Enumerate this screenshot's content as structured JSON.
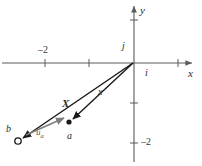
{
  "figure": {
    "type": "vector-diagram",
    "width": 202,
    "height": 166,
    "background": "#ffffff",
    "colors": {
      "axis": "#5a5a5a",
      "vector": "#1a1a1a",
      "unit_vector": "#7d7d7d",
      "text": "#2b2b2b"
    }
  },
  "axes": {
    "x_label": "x",
    "y_label": "y",
    "origin_px": {
      "x": 134,
      "y": 63
    },
    "x_ticks": [
      {
        "label": "-2",
        "px": 45
      },
      {
        "label": "",
        "px": 89
      },
      {
        "label": "",
        "px": 178
      }
    ],
    "y_ticks": [
      {
        "label": "",
        "px": 20
      },
      {
        "label": "",
        "px": 103
      },
      {
        "label": "-2",
        "px": 143
      }
    ],
    "x_tick_label": "–2",
    "y_tick_label": "–2"
  },
  "unit_vectors": {
    "i_label": "i",
    "j_label": "j"
  },
  "vectors": [
    {
      "name": "X-bold",
      "label": "X",
      "style": "bold",
      "from_px": {
        "x": 134,
        "y": 63
      },
      "to_px": {
        "x": 18,
        "y": 141
      },
      "endpoint_marker": "open-circle",
      "endpoint_label": "b"
    },
    {
      "name": "x-italic",
      "label": "x",
      "style": "italic",
      "from_px": {
        "x": 134,
        "y": 63
      },
      "to_px": {
        "x": 69,
        "y": 122
      },
      "endpoint_marker": "filled-dot",
      "endpoint_label": "a"
    }
  ],
  "points": [
    {
      "label": "b",
      "px": {
        "x": 18,
        "y": 141
      },
      "marker": "open-circle"
    },
    {
      "label": "a",
      "px": {
        "x": 69,
        "y": 122
      },
      "marker": "filled-dot"
    }
  ],
  "annotations": [
    {
      "name": "u-a-arrow",
      "label_main": "u",
      "label_sub": "a",
      "color": "#7d7d7d",
      "from_px": {
        "x": 24,
        "y": 136
      },
      "to_px": {
        "x": 64,
        "y": 119
      }
    }
  ]
}
